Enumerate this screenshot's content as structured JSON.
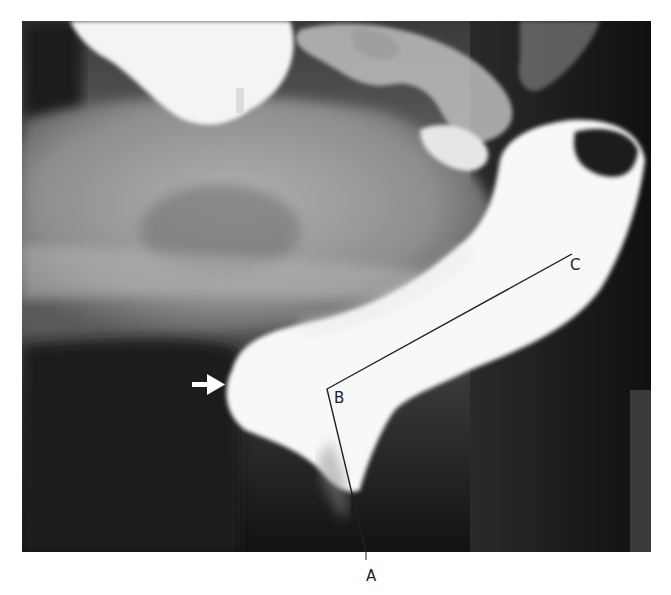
{
  "figure": {
    "type": "radiograph",
    "labels": {
      "a": "A",
      "b": "B",
      "c": "C"
    },
    "annotations": {
      "arrow": "white-arrow-pointing-right",
      "line_path": [
        "A",
        "B",
        "C"
      ]
    },
    "colors": {
      "background": "#ffffff",
      "contrast_fill": "#f7f7f7",
      "soft_tissue": "#9a9a9a",
      "dark_field": "#151515",
      "line": "#222222"
    }
  }
}
